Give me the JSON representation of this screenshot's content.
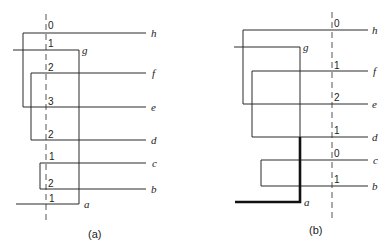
{
  "panels": [
    {
      "caption": "(a)",
      "leaves": {
        "h": "h",
        "g": "g",
        "f": "f",
        "e": "e",
        "d": "d",
        "c": "c",
        "b": "b",
        "a": "a"
      },
      "cut_counts": [
        "0",
        "1",
        "2",
        "3",
        "2",
        "1",
        "2",
        "1"
      ]
    },
    {
      "caption": "(b)",
      "leaves": {
        "h": "h",
        "g": "g",
        "f": "f",
        "e": "e",
        "d": "d",
        "c": "c",
        "b": "b",
        "a": "a"
      },
      "cut_counts": [
        "0",
        "1",
        "2",
        "1",
        "0",
        "1"
      ]
    }
  ]
}
